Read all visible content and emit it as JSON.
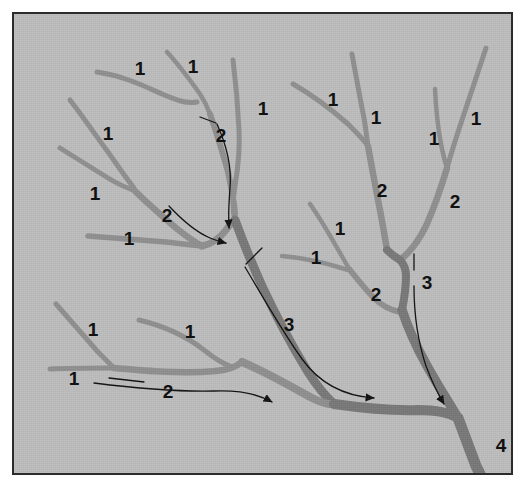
{
  "figure": {
    "background_color": "#bdbdbd",
    "frame_border_color": "#2b2b2b",
    "page_color": "#ffffff",
    "stream_color_light": "#8f8f8f",
    "stream_color_dark": "#787878",
    "annotation_color": "#111111"
  },
  "labels": [
    {
      "text": "1",
      "x": 126,
      "y": 54
    },
    {
      "text": "1",
      "x": 179,
      "y": 52
    },
    {
      "text": "1",
      "x": 249,
      "y": 94
    },
    {
      "text": "2",
      "x": 207,
      "y": 121
    },
    {
      "text": "1",
      "x": 94,
      "y": 119
    },
    {
      "text": "1",
      "x": 81,
      "y": 179
    },
    {
      "text": "2",
      "x": 153,
      "y": 201
    },
    {
      "text": "1",
      "x": 115,
      "y": 224
    },
    {
      "text": "1",
      "x": 79,
      "y": 315
    },
    {
      "text": "1",
      "x": 176,
      "y": 317
    },
    {
      "text": "1",
      "x": 60,
      "y": 364
    },
    {
      "text": "2",
      "x": 154,
      "y": 377
    },
    {
      "text": "3",
      "x": 275,
      "y": 310
    },
    {
      "text": "1",
      "x": 319,
      "y": 85
    },
    {
      "text": "1",
      "x": 362,
      "y": 103
    },
    {
      "text": "1",
      "x": 420,
      "y": 124
    },
    {
      "text": "1",
      "x": 462,
      "y": 104
    },
    {
      "text": "2",
      "x": 368,
      "y": 176
    },
    {
      "text": "2",
      "x": 441,
      "y": 187
    },
    {
      "text": "1",
      "x": 326,
      "y": 214
    },
    {
      "text": "1",
      "x": 302,
      "y": 243
    },
    {
      "text": "2",
      "x": 362,
      "y": 280
    },
    {
      "text": "3",
      "x": 413,
      "y": 268
    },
    {
      "text": "4",
      "x": 487,
      "y": 431
    }
  ],
  "stream_network": {
    "description": "Dendritic stream network with Strahler order annotations 1 through 4",
    "orders_present": [
      1,
      2,
      3,
      4
    ],
    "outlet_order": 4
  },
  "flow_arrows": {
    "count": 5,
    "description": "Curved arrows indicating downstream flow direction"
  }
}
